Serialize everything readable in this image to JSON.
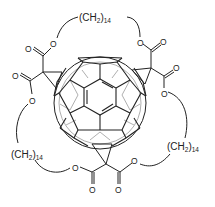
{
  "diagram": {
    "type": "chemical-structure",
    "colors": {
      "stroke": "#222222",
      "inner_bonds": "#9a9a9a",
      "background": "#ffffff"
    },
    "chain_labels": [
      {
        "prefix": "(CH",
        "sub1": "2",
        "mid": ")",
        "sub2": "14"
      },
      {
        "prefix": "(CH",
        "sub1": "2",
        "mid": ")",
        "sub2": "14"
      },
      {
        "prefix": "(CH",
        "sub1": "2",
        "mid": ")",
        "sub2": "14"
      }
    ],
    "atoms": {
      "oxygen": "O"
    },
    "core": "C60"
  }
}
